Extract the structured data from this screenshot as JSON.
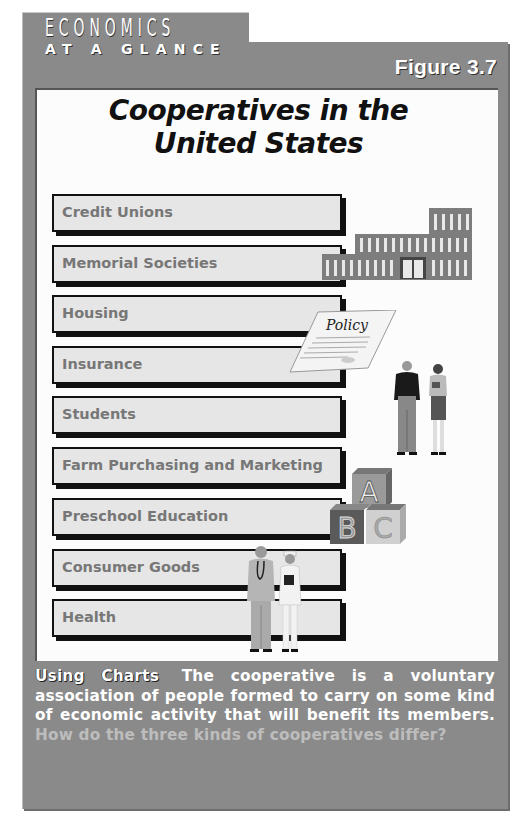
{
  "header": {
    "brand_line1": "ECONOMICS",
    "brand_line2": "AT A GLANCE",
    "figure_label": "Figure 3.7"
  },
  "title": {
    "line1": "Cooperatives in the",
    "line2": "United States"
  },
  "categories": [
    {
      "label": "Credit Unions"
    },
    {
      "label": "Memorial Societies"
    },
    {
      "label": "Housing"
    },
    {
      "label": "Insurance"
    },
    {
      "label": "Students"
    },
    {
      "label": "Farm Purchasing and Marketing"
    },
    {
      "label": "Preschool Education"
    },
    {
      "label": "Consumer Goods"
    },
    {
      "label": "Health"
    }
  ],
  "illustrations": {
    "policy_text": "Policy",
    "blocks": [
      "A",
      "B",
      "C"
    ],
    "icons": [
      "building-icon",
      "policy-document-icon",
      "students-icon",
      "abc-blocks-icon",
      "doctor-nurse-icon"
    ]
  },
  "caption": {
    "lead": "Using Charts",
    "body": "The cooperative is a voluntary association of people formed to carry on some kind of economic activity that will benefit its members.",
    "question": "How do the three kinds of cooperatives differ?"
  },
  "colors": {
    "frame": "#8a8a8a",
    "panel": "#fcfcfc",
    "box_fill": "#e6e6e6",
    "box_text": "#777777",
    "question_text": "#bdbdbd"
  }
}
